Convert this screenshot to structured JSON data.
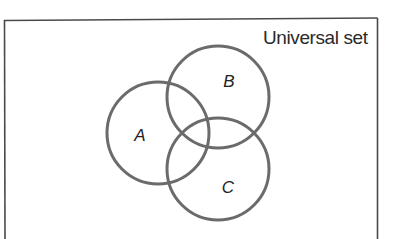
{
  "diagram": {
    "type": "venn",
    "universe_label": "Universal set",
    "sets": [
      {
        "id": "A",
        "label": "A",
        "cx": 158,
        "cy": 133,
        "r": 51,
        "label_x": 140,
        "label_y": 141
      },
      {
        "id": "B",
        "label": "B",
        "cx": 218,
        "cy": 97,
        "r": 51,
        "label_x": 229,
        "label_y": 87
      },
      {
        "id": "C",
        "label": "C",
        "cx": 218,
        "cy": 169,
        "r": 51,
        "label_x": 228,
        "label_y": 193
      }
    ],
    "colors": {
      "circle_stroke": "#6b6b6b",
      "frame_stroke": "#4a4a4a",
      "text": "#222222",
      "background": "#ffffff"
    }
  }
}
